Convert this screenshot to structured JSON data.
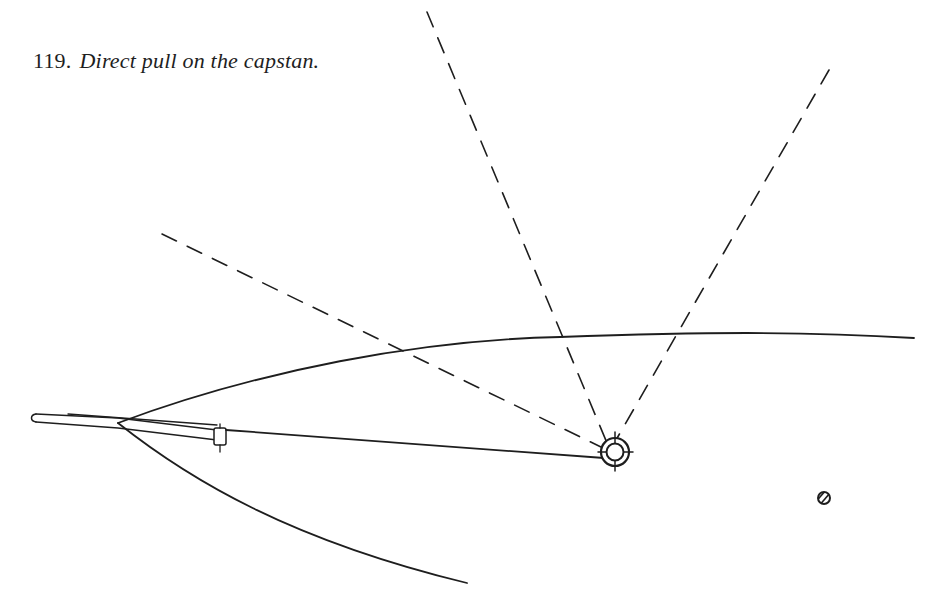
{
  "figure": {
    "number": "119.",
    "caption": "Direct pull on the capstan."
  },
  "diagram": {
    "stroke_color": "#1e1e1e",
    "background": "#ffffff",
    "elements": {
      "hull_upper_edge": "curve",
      "hull_lower_edge": "curve",
      "bowsprit": "spar",
      "pull_line": "solid line from spar fitting to capstan",
      "dashed_leads": [
        "left-lead",
        "upper-lead",
        "right-lead"
      ],
      "capstan": "ringed circle with crosshair ticks",
      "small_post": "hatched circle"
    }
  }
}
